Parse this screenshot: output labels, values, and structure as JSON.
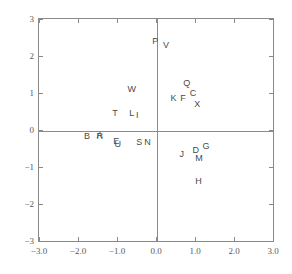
{
  "chart_data": {
    "type": "scatter",
    "title": "",
    "subtitle": "",
    "xlabel": "",
    "ylabel": "",
    "xlim": [
      -3.0,
      3.0
    ],
    "ylim": [
      -3.0,
      3.0
    ],
    "grid": false,
    "legend": null,
    "marker_style": "text-label",
    "xticks": [
      -3.0,
      -2.0,
      -1.0,
      0.0,
      1.0,
      2.0,
      3.0
    ],
    "xticklabels": [
      "-3.0",
      "-2.0",
      "-1.0",
      "0.0",
      "1.0",
      "2.0",
      "3.0"
    ],
    "yticks": [
      -3,
      -2,
      -1,
      0,
      1,
      2,
      3
    ],
    "yticklabels": [
      "-3",
      "-2",
      "-1",
      "0",
      "1",
      "2",
      "3"
    ],
    "axis_lines_at_zero": true,
    "points": [
      {
        "label": "P",
        "x": -0.02,
        "y": 2.41
      },
      {
        "label": "V",
        "x": 0.26,
        "y": 2.3
      },
      {
        "label": "Q",
        "x": 0.79,
        "y": 1.27
      },
      {
        "label": "W",
        "x": -0.62,
        "y": 1.12
      },
      {
        "label": "C",
        "x": 0.95,
        "y": 1.01
      },
      {
        "label": "K",
        "x": 0.45,
        "y": 0.87
      },
      {
        "label": "F",
        "x": 0.69,
        "y": 0.87
      },
      {
        "label": "X",
        "x": 1.06,
        "y": 0.71
      },
      {
        "label": "T",
        "x": -1.05,
        "y": 0.46
      },
      {
        "label": "L",
        "x": -0.62,
        "y": 0.46
      },
      {
        "label": "I",
        "x": -0.48,
        "y": 0.41
      },
      {
        "label": "B",
        "x": -1.77,
        "y": -0.17
      },
      {
        "label": "R",
        "x": -1.44,
        "y": -0.17
      },
      {
        "label": "A",
        "x": -1.44,
        "y": -0.14
      },
      {
        "label": "E",
        "x": -1.02,
        "y": -0.3
      },
      {
        "label": "U",
        "x": -0.98,
        "y": -0.39
      },
      {
        "label": "S",
        "x": -0.43,
        "y": -0.33
      },
      {
        "label": "N",
        "x": -0.22,
        "y": -0.33
      },
      {
        "label": "G",
        "x": 1.28,
        "y": -0.43
      },
      {
        "label": "D",
        "x": 1.02,
        "y": -0.54
      },
      {
        "label": "J",
        "x": 0.66,
        "y": -0.65
      },
      {
        "label": "M",
        "x": 1.1,
        "y": -0.77
      },
      {
        "label": "H",
        "x": 1.09,
        "y": -1.39
      }
    ]
  },
  "style": {
    "frame_color": "#8a8a8a",
    "axis_color": "#8a8a8a",
    "label_color": "#5a5a5a",
    "point_color": "#4a4a4a",
    "background": "#ffffff"
  }
}
